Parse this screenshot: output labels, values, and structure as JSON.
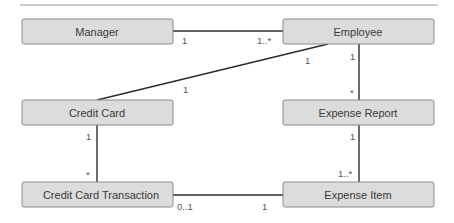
{
  "diagram": {
    "type": "UML class diagram",
    "classes": [
      {
        "id": "manager",
        "label": "Manager"
      },
      {
        "id": "employee",
        "label": "Employee"
      },
      {
        "id": "credit_card",
        "label": "Credit Card"
      },
      {
        "id": "expense_report",
        "label": "Expense Report"
      },
      {
        "id": "cc_transaction",
        "label": "Credit Card Transaction"
      },
      {
        "id": "expense_item",
        "label": "Expense Item"
      }
    ],
    "associations": [
      {
        "id": "manager_employee",
        "from": "manager",
        "to": "employee",
        "from_mult": "1",
        "to_mult": "1..*"
      },
      {
        "id": "employee_creditcard",
        "from": "employee",
        "to": "credit_card",
        "from_mult": "1",
        "to_mult": "1"
      },
      {
        "id": "employee_report",
        "from": "employee",
        "to": "expense_report",
        "from_mult": "1",
        "to_mult": "*"
      },
      {
        "id": "creditcard_transaction",
        "from": "credit_card",
        "to": "cc_transaction",
        "from_mult": "1",
        "to_mult": "*"
      },
      {
        "id": "report_item",
        "from": "expense_report",
        "to": "expense_item",
        "from_mult": "1",
        "to_mult": "1..*"
      },
      {
        "id": "transaction_item",
        "from": "cc_transaction",
        "to": "expense_item",
        "from_mult": "0..1",
        "to_mult": "1"
      }
    ],
    "colors": {
      "box_fill": "#dcdcdc",
      "box_border": "#8a8a8a",
      "line": "#2a2a2a",
      "text": "#3a3a3a"
    }
  }
}
